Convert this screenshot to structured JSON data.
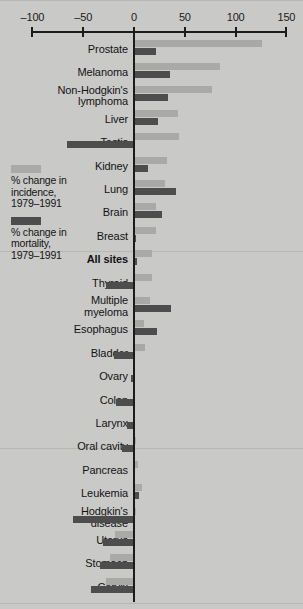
{
  "chart_data": {
    "type": "bar",
    "orientation": "horizontal",
    "title": "",
    "xlabel": "",
    "ylabel": "",
    "xlim": [
      -100,
      150
    ],
    "grid": false,
    "zero_reference_line": true,
    "legend_position": "left-middle",
    "axis_ticks": [
      -100,
      -50,
      0,
      50,
      100,
      150
    ],
    "axis_tick_labels": [
      "–100",
      "–50",
      "0",
      "50",
      "100",
      "150"
    ],
    "categories": [
      "Prostate",
      "Melanoma",
      "Non-Hodgkin's\nlymphoma",
      "Liver",
      "Testis",
      "Kidney",
      "Lung",
      "Brain",
      "Breast",
      "All sites",
      "Thyroid",
      "Multiple\nmyeloma",
      "Esophagus",
      "Bladder",
      "Ovary",
      "Colon",
      "Larynx",
      "Oral cavity",
      "Pancreas",
      "Leukemia",
      "Hodgkin's\ndisease",
      "Uterus",
      "Stomach",
      "Cervix"
    ],
    "series": [
      {
        "name": "% change in incidence, 1979–1991",
        "key": "incidence",
        "color": "#a9a9a7",
        "values": [
          126,
          85,
          77,
          43,
          44,
          32,
          31,
          22,
          22,
          18,
          18,
          16,
          10,
          11,
          1,
          0,
          0,
          2,
          4,
          8,
          2,
          -19,
          -24,
          -28
        ]
      },
      {
        "name": "% change in mortality, 1979–1991",
        "key": "mortality",
        "color": "#4d4d4d",
        "values": [
          22,
          35,
          33,
          24,
          -66,
          14,
          41,
          28,
          2,
          3,
          -28,
          36,
          23,
          -20,
          -3,
          -18,
          -7,
          -12,
          1,
          5,
          -60,
          -31,
          -33,
          -42
        ]
      }
    ],
    "bold_categories": [
      "All sites"
    ]
  },
  "legend": {
    "entries": [
      {
        "swatch": "incidence",
        "label": "% change in\nincidence,\n1979–1991"
      },
      {
        "swatch": "mortality",
        "label": "% change in\nmortality,\n1979–1991"
      }
    ]
  },
  "colors": {
    "background": "#c9c9c7",
    "incidence": "#a9a9a7",
    "mortality": "#4d4d4d",
    "axis": "#1b1b1b",
    "text": "#131313"
  }
}
